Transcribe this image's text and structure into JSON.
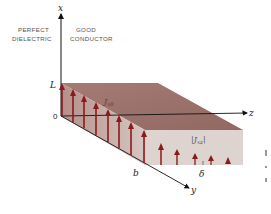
{
  "diagram": {
    "labels": {
      "left_region_line1": "PERFECT",
      "left_region_line2": "DIELECTRIC",
      "right_region_line1": "GOOD",
      "right_region_line2": "CONDUCTOR"
    },
    "axes": {
      "x": "x",
      "y": "y",
      "z": "z",
      "L": "L",
      "origin": "0",
      "b": "b",
      "delta": "δ"
    },
    "current_labels": {
      "surface": "J",
      "surface_sub": "x0",
      "depth": "|J",
      "depth_sub": "xz",
      "depth_close": "|"
    },
    "colors": {
      "top_face": "#9b6e68",
      "side_face": "#c8aaa6",
      "front_face": "#ddd3cf",
      "arrow": "#8b1a1a",
      "axis": "#111111"
    }
  }
}
